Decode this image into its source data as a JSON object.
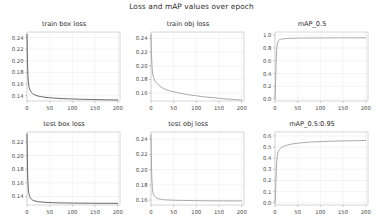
{
  "figure": {
    "title": "Loss and mAP values over epoch",
    "background": "#ffffff",
    "grid": true,
    "rows": 2,
    "cols": 3
  },
  "chart_data": [
    {
      "type": "line",
      "title": "train box loss",
      "xlabel": "",
      "ylabel": "",
      "xlim": [
        0,
        205
      ],
      "ylim": [
        0.131,
        0.2495
      ],
      "xticks": [
        0,
        50,
        100,
        150,
        200
      ],
      "yticks": [
        0.14,
        0.16,
        0.18,
        0.2,
        0.22,
        0.24
      ],
      "ytick_labels": [
        "0.14",
        "0.16",
        "0.18",
        "0.20",
        "0.22",
        "0.24"
      ],
      "xtick_labels": [
        "0",
        "50",
        "100",
        "150",
        "200"
      ],
      "grid": true,
      "legend": "none",
      "color": "#4d4d4d",
      "series": [
        {
          "name": "train box loss",
          "x": [
            0,
            1,
            2,
            3,
            4,
            5,
            6,
            8,
            10,
            12,
            15,
            20,
            25,
            30,
            40,
            50,
            60,
            70,
            80,
            90,
            100,
            110,
            120,
            130,
            140,
            150,
            160,
            170,
            180,
            190,
            200
          ],
          "values": [
            0.2455,
            0.2005,
            0.1745,
            0.1638,
            0.1575,
            0.1538,
            0.1512,
            0.1478,
            0.1455,
            0.144,
            0.1424,
            0.1406,
            0.1394,
            0.1386,
            0.1374,
            0.1366,
            0.136,
            0.1355,
            0.1351,
            0.1348,
            0.1345,
            0.1343,
            0.134,
            0.1338,
            0.1336,
            0.1334,
            0.1333,
            0.1331,
            0.133,
            0.1329,
            0.1328
          ]
        }
      ]
    },
    {
      "type": "line",
      "title": "train obj loss",
      "xlabel": "",
      "ylabel": "",
      "xlim": [
        0,
        205
      ],
      "ylim": [
        0.1485,
        0.2495
      ],
      "xticks": [
        0,
        50,
        100,
        150,
        200
      ],
      "yticks": [
        0.16,
        0.18,
        0.2,
        0.22,
        0.24
      ],
      "ytick_labels": [
        "0.16",
        "0.18",
        "0.20",
        "0.22",
        "0.24"
      ],
      "xtick_labels": [
        "0",
        "50",
        "100",
        "150",
        "200"
      ],
      "grid": true,
      "legend": "none",
      "color": "#9b9b9b",
      "series": [
        {
          "name": "train obj loss",
          "x": [
            0,
            1,
            2,
            3,
            4,
            5,
            6,
            8,
            10,
            15,
            20,
            25,
            30,
            40,
            50,
            60,
            70,
            80,
            90,
            100,
            110,
            120,
            130,
            140,
            150,
            160,
            170,
            180,
            190,
            200
          ],
          "values": [
            0.2462,
            0.2175,
            0.202,
            0.1925,
            0.1875,
            0.1842,
            0.182,
            0.179,
            0.1768,
            0.173,
            0.17,
            0.1678,
            0.166,
            0.1636,
            0.162,
            0.1605,
            0.1592,
            0.158,
            0.157,
            0.1562,
            0.1552,
            0.1544,
            0.1538,
            0.1532,
            0.1524,
            0.1518,
            0.1512,
            0.1508,
            0.1504,
            0.15
          ]
        }
      ]
    },
    {
      "type": "line",
      "title": "mAP_0.5",
      "xlabel": "",
      "ylabel": "",
      "xlim": [
        0,
        205
      ],
      "ylim": [
        -0.03,
        1.05
      ],
      "xticks": [
        0,
        50,
        100,
        150,
        200
      ],
      "yticks": [
        0.0,
        0.2,
        0.4,
        0.6,
        0.8,
        1.0
      ],
      "ytick_labels": [
        "0.0",
        "0.2",
        "0.4",
        "0.6",
        "0.8",
        "1.0"
      ],
      "xtick_labels": [
        "0",
        "50",
        "100",
        "150",
        "200"
      ],
      "grid": true,
      "legend": "none",
      "color": "#9b9b9b",
      "series": [
        {
          "name": "mAP_0.5",
          "x": [
            0,
            1,
            2,
            3,
            4,
            5,
            6,
            8,
            10,
            12,
            15,
            20,
            25,
            30,
            40,
            50,
            60,
            80,
            100,
            120,
            140,
            160,
            180,
            200
          ],
          "values": [
            0.005,
            0.18,
            0.45,
            0.66,
            0.78,
            0.855,
            0.89,
            0.915,
            0.928,
            0.934,
            0.94,
            0.945,
            0.948,
            0.95,
            0.952,
            0.954,
            0.955,
            0.956,
            0.957,
            0.958,
            0.958,
            0.959,
            0.959,
            0.96
          ]
        }
      ]
    },
    {
      "type": "line",
      "title": "test box loss",
      "xlabel": "",
      "ylabel": "",
      "xlim": [
        0,
        205
      ],
      "ylim": [
        0.1275,
        0.2345
      ],
      "xticks": [
        0,
        50,
        100,
        150,
        200
      ],
      "yticks": [
        0.14,
        0.16,
        0.18,
        0.2,
        0.22
      ],
      "ytick_labels": [
        "0.14",
        "0.16",
        "0.18",
        "0.20",
        "0.22"
      ],
      "xtick_labels": [
        "0",
        "50",
        "100",
        "150",
        "200"
      ],
      "grid": true,
      "legend": "none",
      "color": "#4d4d4d",
      "series": [
        {
          "name": "test box loss",
          "x": [
            0,
            1,
            2,
            3,
            4,
            5,
            6,
            8,
            10,
            12,
            15,
            20,
            25,
            30,
            40,
            50,
            60,
            70,
            80,
            100,
            120,
            140,
            160,
            180,
            200
          ],
          "values": [
            0.2315,
            0.1855,
            0.1615,
            0.1508,
            0.1448,
            0.1418,
            0.1398,
            0.1375,
            0.1358,
            0.1348,
            0.134,
            0.133,
            0.1324,
            0.132,
            0.1314,
            0.1311,
            0.1308,
            0.1306,
            0.1305,
            0.1303,
            0.1302,
            0.1301,
            0.13,
            0.13,
            0.1299
          ]
        }
      ]
    },
    {
      "type": "line",
      "title": "test obj loss",
      "xlabel": "",
      "ylabel": "",
      "xlim": [
        0,
        205
      ],
      "ylim": [
        0.1535,
        0.2495
      ],
      "xticks": [
        0,
        50,
        100,
        150,
        200
      ],
      "yticks": [
        0.16,
        0.18,
        0.2,
        0.22,
        0.24
      ],
      "ytick_labels": [
        "0.16",
        "0.18",
        "0.20",
        "0.22",
        "0.24"
      ],
      "xtick_labels": [
        "0",
        "50",
        "100",
        "150",
        "200"
      ],
      "grid": true,
      "legend": "none",
      "color": "#9b9b9b",
      "series": [
        {
          "name": "test obj loss",
          "x": [
            0,
            1,
            2,
            3,
            4,
            5,
            6,
            8,
            10,
            12,
            15,
            20,
            25,
            30,
            40,
            50,
            60,
            70,
            80,
            100,
            120,
            140,
            160,
            180,
            200
          ],
          "values": [
            0.2455,
            0.2075,
            0.186,
            0.1762,
            0.1712,
            0.1685,
            0.1668,
            0.1648,
            0.1635,
            0.1628,
            0.162,
            0.1612,
            0.1607,
            0.1604,
            0.16,
            0.1598,
            0.1596,
            0.1595,
            0.1594,
            0.1592,
            0.1591,
            0.159,
            0.1589,
            0.1589,
            0.1588
          ]
        }
      ]
    },
    {
      "type": "line",
      "title": "mAP_0.5:0.95",
      "xlabel": "",
      "ylabel": "",
      "xlim": [
        0,
        205
      ],
      "ylim": [
        -0.02,
        0.635
      ],
      "xticks": [
        0,
        50,
        100,
        150,
        200
      ],
      "yticks": [
        0.0,
        0.1,
        0.2,
        0.3,
        0.4,
        0.5,
        0.6
      ],
      "ytick_labels": [
        "0.0",
        "0.1",
        "0.2",
        "0.3",
        "0.4",
        "0.5",
        "0.6"
      ],
      "xtick_labels": [
        "0",
        "50",
        "100",
        "150",
        "200"
      ],
      "grid": true,
      "legend": "none",
      "color": "#9b9b9b",
      "series": [
        {
          "name": "mAP_0.5:0.95",
          "x": [
            0,
            1,
            2,
            3,
            4,
            5,
            6,
            8,
            10,
            12,
            15,
            20,
            25,
            30,
            40,
            50,
            60,
            70,
            80,
            100,
            120,
            140,
            160,
            180,
            200
          ],
          "values": [
            0.002,
            0.065,
            0.185,
            0.3,
            0.375,
            0.42,
            0.445,
            0.468,
            0.48,
            0.488,
            0.497,
            0.508,
            0.515,
            0.521,
            0.529,
            0.534,
            0.539,
            0.542,
            0.545,
            0.549,
            0.552,
            0.554,
            0.556,
            0.557,
            0.559
          ]
        }
      ]
    }
  ]
}
